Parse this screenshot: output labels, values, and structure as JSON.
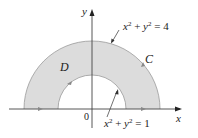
{
  "diagram": {
    "type": "annular-half-region",
    "colors": {
      "region_fill": "#dcdcdc",
      "stroke": "#444444",
      "background": "#ffffff"
    },
    "axes": {
      "x_label": "x",
      "y_label": "y",
      "origin_label": "0"
    },
    "region_label": "D",
    "curve_label": "C",
    "outer_circle": {
      "lhs_x": "x",
      "lhs_y": "y",
      "exp": "2",
      "rhs": "= 4",
      "equation": "x^2 + y^2 = 4"
    },
    "inner_circle": {
      "lhs_x": "x",
      "lhs_y": "y",
      "exp": "2",
      "rhs": "= 1",
      "equation": "x^2 + y^2 = 1"
    }
  }
}
